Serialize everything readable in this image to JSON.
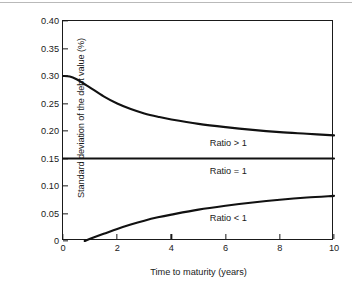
{
  "chart_data": {
    "type": "line",
    "title": "",
    "xlabel": "Time to maturity (years)",
    "ylabel": "Standard deviation of the debt value (%)",
    "xlim": [
      0,
      10
    ],
    "ylim": [
      0,
      0.4
    ],
    "grid": false,
    "legend_position": "inline-annotations",
    "xticks": [
      "0",
      "2",
      "4",
      "6",
      "8",
      "10"
    ],
    "xtick_values": [
      0,
      2,
      4,
      6,
      8,
      10
    ],
    "yticks": [
      "0",
      "0.05",
      "0.10",
      "0.15",
      "0.20",
      "0.25",
      "0.30",
      "0.35",
      "0.40"
    ],
    "ytick_values": [
      0,
      0.05,
      0.1,
      0.15,
      0.2,
      0.25,
      0.3,
      0.35,
      0.4
    ],
    "x": [
      0,
      0.25,
      0.5,
      0.8,
      1,
      1.5,
      2,
      2.5,
      3,
      3.5,
      4,
      5,
      6,
      7,
      8,
      9,
      10
    ],
    "series": [
      {
        "name": "Ratio > 1",
        "values": [
          0.3,
          0.299,
          0.294,
          0.285,
          0.279,
          0.263,
          0.25,
          0.24,
          0.232,
          0.226,
          0.221,
          0.213,
          0.207,
          0.202,
          0.198,
          0.195,
          0.192
        ]
      },
      {
        "name": "Ratio = 1",
        "values": [
          0.15,
          0.15,
          0.15,
          0.15,
          0.15,
          0.15,
          0.15,
          0.15,
          0.15,
          0.15,
          0.15,
          0.15,
          0.15,
          0.15,
          0.15,
          0.15,
          0.15
        ]
      },
      {
        "name": "Ratio < 1",
        "values": [
          0.0,
          0.0,
          0.0,
          0.0,
          0.004,
          0.013,
          0.022,
          0.03,
          0.037,
          0.043,
          0.048,
          0.057,
          0.064,
          0.07,
          0.075,
          0.079,
          0.082
        ]
      }
    ],
    "annotations": [
      {
        "text": "Ratio > 1",
        "x": 6.1,
        "y": 0.178
      },
      {
        "text": "Ratio = 1",
        "x": 6.1,
        "y": 0.128
      },
      {
        "text": "Ratio < 1",
        "x": 6.1,
        "y": 0.042
      }
    ]
  },
  "colors": {
    "line": "#111111",
    "axis": "#1a1a1a",
    "background": "#ffffff",
    "top_rule": "#b9b9b9"
  }
}
